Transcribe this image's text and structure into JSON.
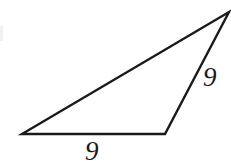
{
  "figure": {
    "type": "triangle-diagram",
    "background_color": "#ffffff",
    "stroke_color": "#1a1a1a",
    "stroke_width": 2.4,
    "canvas": {
      "width": 231,
      "height": 161
    },
    "vertices": {
      "apex": {
        "x": 229,
        "y": 12
      },
      "bottom_left": {
        "x": 22,
        "y": 134
      },
      "bottom_right": {
        "x": 165,
        "y": 134
      }
    },
    "labels": {
      "right_side": "9",
      "bottom_side": "9"
    }
  }
}
